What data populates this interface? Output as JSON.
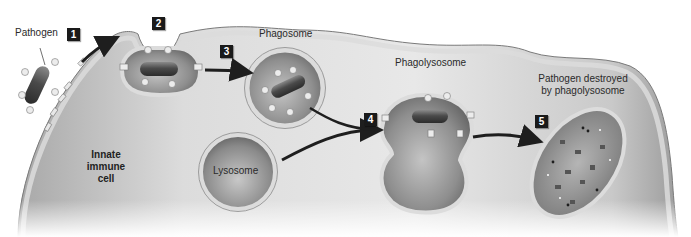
{
  "diagram": {
    "cell_label": "Innate\nimmune\ncell",
    "cell_label_lines": [
      "Innate",
      "immune",
      "cell"
    ],
    "labels": {
      "pathogen": "Pathogen",
      "phagosome": "Phagosome",
      "phagolysosome": "Phagolysosome",
      "lysosome": "Lysosome",
      "destroyed_line1": "Pathogen destroyed",
      "destroyed_line2": "by phagolysosome"
    },
    "steps": [
      {
        "number": "1",
        "description": "Pathogen binds to receptors on cell membrane"
      },
      {
        "number": "2",
        "description": "Membrane engulfs pathogen"
      },
      {
        "number": "3",
        "description": "Phagosome forms"
      },
      {
        "number": "4",
        "description": "Lysosome fuses with phagosome forming phagolysosome"
      },
      {
        "number": "5",
        "description": "Pathogen destroyed by phagolysosome"
      }
    ],
    "colors": {
      "cytoplasm_light": "#e6e6e6",
      "cytoplasm_dark": "#9a9a9a",
      "membrane": "#d8d8d8",
      "membrane_edge": "#7a7a7a",
      "vesicle_dark": "#6f6f6f",
      "vesicle_light": "#bdbdbd",
      "pathogen": "#4a4a4a",
      "step_box": "#1a1a1a",
      "arrow": "#1e1e1e"
    }
  }
}
